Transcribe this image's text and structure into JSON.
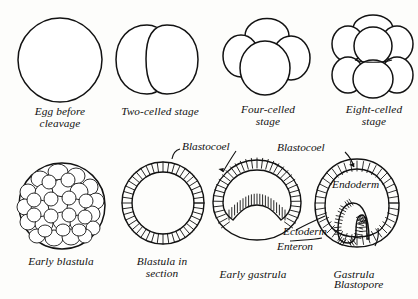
{
  "plate": {
    "title": "Stages of early embryonic development",
    "background_color": "#fdfdfb",
    "ink_color": "#121212"
  },
  "stages": [
    {
      "id": "egg",
      "caption": "Egg before\ncleavage",
      "cells": 1,
      "figure": "single-circle"
    },
    {
      "id": "two-cell",
      "caption": "Two-celled stage",
      "cells": 2,
      "figure": "two-ovals"
    },
    {
      "id": "four-cell",
      "caption": "Four-celled\nstage",
      "cells": 4,
      "figure": "four-cluster"
    },
    {
      "id": "eight-cell",
      "caption": "Eight-celled\nstage",
      "cells": 8,
      "figure": "eight-cluster"
    },
    {
      "id": "early-blastula",
      "caption": "Early blastula",
      "cells": 0,
      "figure": "morula"
    },
    {
      "id": "blastula-section",
      "caption": "Blastula in\nsection",
      "cells": 0,
      "figure": "hollow-ring"
    },
    {
      "id": "early-gastrula",
      "caption": "Early gastrula",
      "cells": 0,
      "figure": "shallow-invagination"
    },
    {
      "id": "gastrula",
      "caption": "Gastrula",
      "cells": 0,
      "figure": "deep-invagination"
    }
  ],
  "annotations": [
    {
      "id": "blastocoel-1",
      "label": "Blastocoel"
    },
    {
      "id": "blastocoel-2",
      "label": "Blastocoel"
    },
    {
      "id": "endoderm",
      "label": "Endoderm"
    },
    {
      "id": "ectoderm",
      "label": "Ectoderm"
    },
    {
      "id": "enteron",
      "label": "Enteron"
    },
    {
      "id": "blastopore",
      "label": "Blastopore"
    }
  ]
}
